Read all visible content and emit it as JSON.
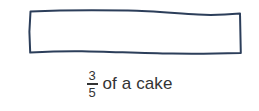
{
  "figure": {
    "kind": "fraction-model-diagram",
    "background_color": "#ffffff",
    "shape": {
      "name": "whole-cake-rectangle",
      "style": "hand-drawn-wavy-outline",
      "stroke_color": "#2c3e5a",
      "fill": "none",
      "stroke_width": 2
    },
    "caption": {
      "fraction": {
        "numerator": "3",
        "denominator": "5"
      },
      "text": "of a cake",
      "full_text": "3/5 of a cake",
      "text_color": "#333333"
    }
  }
}
